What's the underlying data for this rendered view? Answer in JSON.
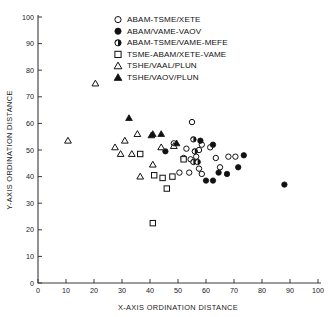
{
  "chart_data": {
    "type": "scatter",
    "title": "",
    "xlabel": "X-AXIS ORDINATION DISTANCE",
    "ylabel": "Y-AXIS ORDINATION DISTANCE",
    "xlim": [
      0,
      100
    ],
    "ylim": [
      0,
      100
    ],
    "xticks": [
      0,
      10,
      20,
      30,
      40,
      50,
      60,
      70,
      80,
      90,
      100
    ],
    "yticks": [
      0,
      10,
      20,
      30,
      40,
      50,
      60,
      70,
      80,
      90,
      100
    ],
    "grid": false,
    "legend_position": "top-center",
    "series": [
      {
        "name": "ABAM-TSME/XETE",
        "marker": "open-circle",
        "points": [
          [
            55.0,
            60.5
          ],
          [
            48.5,
            52.5
          ],
          [
            53.0,
            50.5
          ],
          [
            52.0,
            47.0
          ],
          [
            54.5,
            46.5
          ],
          [
            56.5,
            47.5
          ],
          [
            57.5,
            50.0
          ],
          [
            58.5,
            52.0
          ],
          [
            61.5,
            51.0
          ],
          [
            63.5,
            47.0
          ],
          [
            65.0,
            43.5
          ],
          [
            68.0,
            47.5
          ],
          [
            70.5,
            47.5
          ],
          [
            57.5,
            43.0
          ],
          [
            50.5,
            41.5
          ],
          [
            54.0,
            41.5
          ],
          [
            58.5,
            41.0
          ]
        ]
      },
      {
        "name": "ABAM/VAME-VAOV",
        "marker": "filled-circle",
        "points": [
          [
            45.5,
            49.5
          ],
          [
            58.0,
            53.5
          ],
          [
            62.5,
            52.0
          ],
          [
            73.5,
            48.0
          ],
          [
            64.5,
            41.5
          ],
          [
            67.5,
            41.0
          ],
          [
            71.5,
            43.5
          ],
          [
            60.0,
            38.5
          ],
          [
            62.5,
            38.5
          ],
          [
            88.0,
            37.0
          ]
        ]
      },
      {
        "name": "ABAM-TSME/VAME-MEFE",
        "marker": "half-circle",
        "points": [
          [
            55.5,
            54.0
          ],
          [
            56.0,
            49.5
          ],
          [
            55.5,
            45.5
          ],
          [
            57.0,
            45.5
          ]
        ]
      },
      {
        "name": "TSME-ABAM/XETE-VAME",
        "marker": "open-square",
        "points": [
          [
            41.0,
            22.5
          ],
          [
            46.0,
            35.5
          ],
          [
            41.5,
            40.5
          ],
          [
            44.5,
            39.5
          ],
          [
            48.0,
            40.0
          ],
          [
            52.0,
            46.5
          ],
          [
            36.5,
            48.5
          ]
        ]
      },
      {
        "name": "TSHE/VAAL/PLUN",
        "marker": "open-triangle",
        "points": [
          [
            20.5,
            75.0
          ],
          [
            10.7,
            53.5
          ],
          [
            31.0,
            53.5
          ],
          [
            27.5,
            51.0
          ],
          [
            29.5,
            48.5
          ],
          [
            33.5,
            48.5
          ],
          [
            35.5,
            56.0
          ],
          [
            44.0,
            51.0
          ],
          [
            41.0,
            44.5
          ],
          [
            36.5,
            40.0
          ],
          [
            48.5,
            51.5
          ]
        ]
      },
      {
        "name": "TSHE/VAOV/PLUN",
        "marker": "filled-triangle",
        "points": [
          [
            32.5,
            62.0
          ],
          [
            41.0,
            56.0
          ],
          [
            44.0,
            56.0
          ],
          [
            49.5,
            52.5
          ],
          [
            40.5,
            55.5
          ]
        ]
      }
    ]
  },
  "legend": {
    "items": [
      {
        "label": "ABAM-TSME/XETE",
        "marker": "open-circle"
      },
      {
        "label": "ABAM/VAME-VAOV",
        "marker": "filled-circle"
      },
      {
        "label": "ABAM-TSME/VAME-MEFE",
        "marker": "half-circle"
      },
      {
        "label": "TSME-ABAM/XETE-VAME",
        "marker": "open-square"
      },
      {
        "label": "TSHE/VAAL/PLUN",
        "marker": "open-triangle"
      },
      {
        "label": "TSHE/VAOV/PLUN",
        "marker": "filled-triangle"
      }
    ]
  },
  "colors": {
    "marker": "#111111",
    "axis": "#3a3a3a",
    "background": "#ffffff"
  }
}
